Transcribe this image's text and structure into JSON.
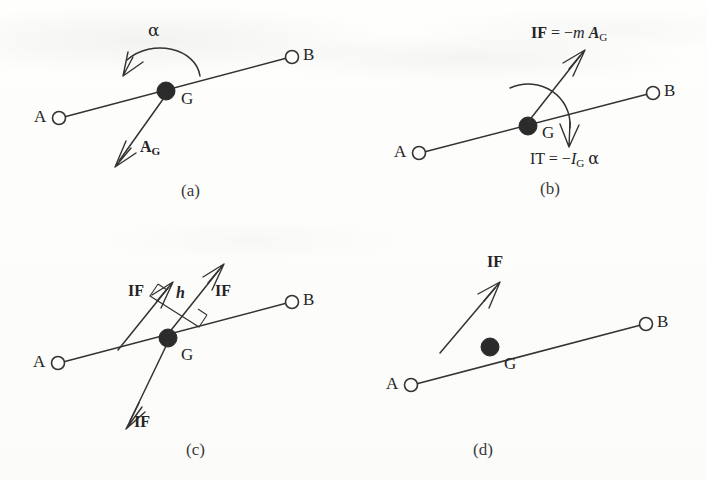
{
  "figure": {
    "kind": "engineering-mechanics-diagram",
    "stroke_color": "#333333",
    "node_fill_color": "#2b2b2b",
    "background_color": "#fdfdfc"
  },
  "panels": [
    {
      "id": "a",
      "caption": "(a)",
      "nodes": [
        {
          "name": "point-a",
          "label": "A"
        },
        {
          "name": "point-b",
          "label": "B"
        },
        {
          "name": "point-g",
          "label": "G"
        }
      ],
      "labels": {
        "alpha": "α",
        "acceleration_vector": "A",
        "acceleration_subscript": "G"
      }
    },
    {
      "id": "b",
      "caption": "(b)",
      "nodes": [
        {
          "name": "point-a",
          "label": "A"
        },
        {
          "name": "point-b",
          "label": "B"
        },
        {
          "name": "point-g",
          "label": "G"
        }
      ],
      "equations": {
        "inertia_force": {
          "lhs": "IF",
          "equals": "=",
          "sign": "−",
          "mass": "m",
          "accel": "A",
          "accel_sub": "G",
          "full_text": "IF = −m A_G"
        },
        "inertia_torque": {
          "lhs": "IT",
          "equals": "=",
          "sign": "−",
          "inertia": "I",
          "inertia_sub": "G",
          "alpha": "α",
          "full_text": "IT = −I_G α"
        }
      }
    },
    {
      "id": "c",
      "caption": "(c)",
      "nodes": [
        {
          "name": "point-a",
          "label": "A"
        },
        {
          "name": "point-b",
          "label": "B"
        },
        {
          "name": "point-g",
          "label": "G"
        }
      ],
      "labels": {
        "if_left": "IF",
        "if_right": "IF",
        "if_down": "IF",
        "offset_distance": "h"
      }
    },
    {
      "id": "d",
      "caption": "(d)",
      "nodes": [
        {
          "name": "point-a",
          "label": "A"
        },
        {
          "name": "point-b",
          "label": "B"
        },
        {
          "name": "point-g",
          "label": "G"
        }
      ],
      "labels": {
        "if": "IF"
      }
    }
  ]
}
